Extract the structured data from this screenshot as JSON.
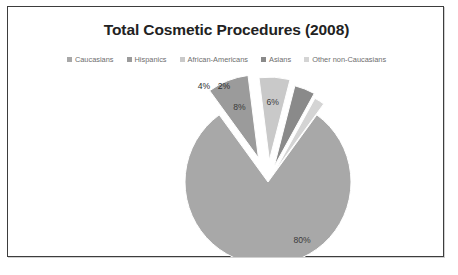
{
  "chart_data": {
    "type": "pie",
    "title": "Total Cosmetic Procedures (2008)",
    "categories": [
      "Caucasians",
      "Hispanics",
      "African-Americans",
      "Asians",
      "Other non-Caucasians"
    ],
    "values": [
      80,
      8,
      6,
      4,
      2
    ],
    "value_labels": [
      "80%",
      "8%",
      "6%",
      "4%",
      "2%"
    ],
    "colors": [
      "#a8a8a8",
      "#9b9b9b",
      "#c9c9c9",
      "#8a8a8a",
      "#d4d4d4"
    ],
    "legend_position": "top",
    "grid": false,
    "exploded_slices": [
      "Hispanics",
      "African-Americans",
      "Asians",
      "Other non-Caucasians"
    ],
    "unit": "percent",
    "xlabel": "",
    "ylabel": ""
  },
  "frame": {
    "border_color": "#3d3d3d",
    "background": "#ffffff"
  },
  "labels": {
    "slice_80": "80%",
    "slice_8": "8%",
    "slice_6": "6%",
    "slice_4": "4%",
    "slice_2": "2%"
  },
  "legend": {
    "items": [
      {
        "label": "Caucasians",
        "color": "#a8a8a8"
      },
      {
        "label": "Hispanics",
        "color": "#9b9b9b"
      },
      {
        "label": "African-Americans",
        "color": "#c9c9c9"
      },
      {
        "label": "Asians",
        "color": "#8a8a8a"
      },
      {
        "label": "Other non-Caucasians",
        "color": "#d4d4d4"
      }
    ]
  }
}
